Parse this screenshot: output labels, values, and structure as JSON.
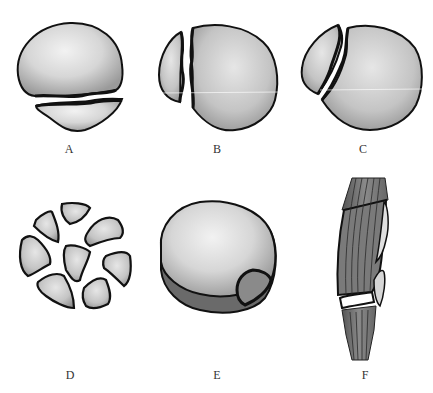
{
  "figure": {
    "panels": [
      {
        "id": "A",
        "label": "A",
        "description": "transverse fracture"
      },
      {
        "id": "B",
        "label": "B",
        "description": "vertical fracture"
      },
      {
        "id": "C",
        "label": "C",
        "description": "oblique fracture"
      },
      {
        "id": "D",
        "label": "D",
        "description": "comminuted fracture"
      },
      {
        "id": "E",
        "label": "E",
        "description": "osteochondral fracture"
      },
      {
        "id": "F",
        "label": "F",
        "description": "avulsion fracture"
      }
    ],
    "colors": {
      "bone_light": "#e8e8e8",
      "bone_mid": "#bdbdbd",
      "bone_dark": "#7a7a7a",
      "outline": "#111111",
      "tendon": "#6e6e6e",
      "background": "#ffffff"
    }
  }
}
